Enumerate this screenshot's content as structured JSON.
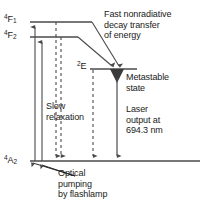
{
  "figure": {
    "type": "energy-level-diagram",
    "background_color": "#ffffff",
    "line_color": "#4a4a4a",
    "text_color": "#1a1a1a"
  },
  "states": {
    "upper_1": {
      "label_sup": "4",
      "label_main": "F",
      "label_sub": "1",
      "y": 22
    },
    "upper_2": {
      "label_sup": "4",
      "label_main": "F",
      "label_sub": "2",
      "y": 37
    },
    "metastable": {
      "label_sup": "2",
      "label_main": "E",
      "label_sub": "",
      "y": 68
    },
    "ground": {
      "label_sup": "4",
      "label_main": "A",
      "label_sub": "2",
      "y": 161
    }
  },
  "annotations": {
    "fast_decay": "Fast nonradiative\ndecay transfer\nof energy",
    "metastable": "Metastable\nstate",
    "laser_output": "Laser\noutput at\n694.3 nm",
    "slow_relaxation": "Slow\nrelaxation",
    "optical_pumping": "Optical\npumping\nby flashlamp"
  },
  "values": {
    "laser_wavelength": "694.3 nm"
  },
  "transitions": {
    "pump_arrows": [
      {
        "name": "pump-to-4F1",
        "x": 35,
        "style": "solid",
        "direction": "up"
      },
      {
        "name": "pump-to-4F2",
        "x": 42,
        "style": "solid",
        "direction": "up"
      }
    ],
    "relaxation_arrows": [
      {
        "name": "slow-relaxation-1",
        "x": 56,
        "style": "dashed",
        "direction": "down"
      },
      {
        "name": "slow-relaxation-2",
        "x": 61,
        "style": "dashed",
        "direction": "down"
      }
    ],
    "nonradiative_decay": [
      {
        "name": "decay-from-4F1",
        "from_x": 92,
        "from_y": 22,
        "to_x": 118,
        "to_y": 69
      },
      {
        "name": "decay-from-4F2",
        "from_x": 78,
        "from_y": 37,
        "to_x": 112,
        "to_y": 69
      }
    ],
    "laser_emission": {
      "name": "laser-output-arrow",
      "x": 117,
      "from_y": 82,
      "to_y": 161
    },
    "dashed_drop": {
      "name": "metastable-dashed-line",
      "x": 93,
      "from_y": 70,
      "to_y": 161
    }
  }
}
